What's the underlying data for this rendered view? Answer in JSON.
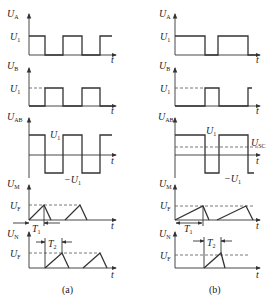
{
  "figure": {
    "panels": [
      {
        "id": "a",
        "caption": "(a)",
        "plots": [
          {
            "name": "UA",
            "ylabel": "U",
            "ylabel_sub": "A",
            "level_label": "U",
            "level_sub": "1",
            "xlabel": "t"
          },
          {
            "name": "UB",
            "ylabel": "U",
            "ylabel_sub": "B",
            "level_label": "U",
            "level_sub": "1",
            "xlabel": "t"
          },
          {
            "name": "UAB",
            "ylabel": "U",
            "ylabel_sub": "AB",
            "high_label": "U",
            "high_sub": "1",
            "low_label": "−U",
            "low_sub": "1",
            "xlabel": "t"
          },
          {
            "name": "UM",
            "ylabel": "U",
            "ylabel_sub": "M",
            "level_label": "U",
            "level_sub": "F",
            "period_label": "T",
            "period_sub": "1",
            "xlabel": "t"
          },
          {
            "name": "UN",
            "ylabel": "U",
            "ylabel_sub": "N",
            "level_label": "U",
            "level_sub": "F",
            "period_label": "T",
            "period_sub": "2",
            "xlabel": "t"
          }
        ]
      },
      {
        "id": "b",
        "caption": "(b)",
        "plots": [
          {
            "name": "UA",
            "ylabel": "U",
            "ylabel_sub": "A",
            "level_label": "U",
            "level_sub": "1",
            "xlabel": "t"
          },
          {
            "name": "UB",
            "ylabel": "U",
            "ylabel_sub": "B",
            "level_label": "U",
            "level_sub": "1",
            "xlabel": "t"
          },
          {
            "name": "UAB",
            "ylabel": "U",
            "ylabel_sub": "AB",
            "high_label": "U",
            "high_sub": "1",
            "low_label": "−U",
            "low_sub": "1",
            "threshold_label": "U",
            "threshold_sub": "SC",
            "xlabel": "t"
          },
          {
            "name": "UM",
            "ylabel": "U",
            "ylabel_sub": "M",
            "level_label": "U",
            "level_sub": "F",
            "period_label": "T",
            "period_sub": "1",
            "xlabel": "t"
          },
          {
            "name": "UN",
            "ylabel": "U",
            "ylabel_sub": "N",
            "level_label": "U",
            "level_sub": "F",
            "period_label": "T",
            "period_sub": "2",
            "xlabel": "t"
          }
        ]
      }
    ]
  }
}
